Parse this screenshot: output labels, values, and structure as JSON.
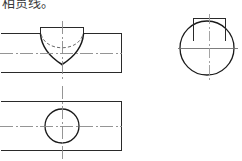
{
  "caption": {
    "text": "相贯线。"
  },
  "colors": {
    "background": "#ffffff",
    "outline": "#1a1a1a",
    "thin_line": "#555555",
    "center_line": "#7a7a7a",
    "hidden_line": "#6a6a6a",
    "caption_text": "#3a3a3a"
  },
  "drawing": {
    "title": "相贯线。",
    "type": "orthographic-projection",
    "views": [
      {
        "name": "front-view",
        "label": "front-view",
        "outline": {
          "x": 1,
          "y": 33,
          "width": 121,
          "height": 40
        },
        "features": [
          {
            "name": "intersection-curve",
            "kind": "visible-curve",
            "description": "downward parabolic intersection curve of vertical cylinder with horizontal body"
          },
          {
            "name": "hidden-arc",
            "kind": "hidden-dashed-arc",
            "description": "dashed arc showing far-side intersection line"
          },
          {
            "name": "vertical-center-line",
            "kind": "center-line"
          },
          {
            "name": "horizontal-center-line",
            "kind": "center-line"
          }
        ]
      },
      {
        "name": "top-view",
        "label": "top-view",
        "outline": {
          "x": 1,
          "y": 101,
          "width": 121,
          "height": 50
        },
        "features": [
          {
            "name": "bore-circle",
            "kind": "visible-circle",
            "cx": 62,
            "cy": 126,
            "r": 17
          },
          {
            "name": "vertical-center-line",
            "kind": "center-line"
          },
          {
            "name": "horizontal-center-line",
            "kind": "center-line"
          }
        ]
      },
      {
        "name": "side-view",
        "label": "side-view",
        "outline": {
          "x": 189,
          "y": 18,
          "width": 46,
          "height": 60
        },
        "features": [
          {
            "name": "body-circle",
            "kind": "visible-circle",
            "cx": 207,
            "cy": 48,
            "r": 27
          },
          {
            "name": "boss-rectangle",
            "kind": "visible-rectangle",
            "x": 193,
            "y": 18,
            "width": 33,
            "height": 23
          },
          {
            "name": "vertical-center-line",
            "kind": "center-line"
          },
          {
            "name": "horizontal-center-line",
            "kind": "center-line"
          }
        ]
      }
    ]
  }
}
